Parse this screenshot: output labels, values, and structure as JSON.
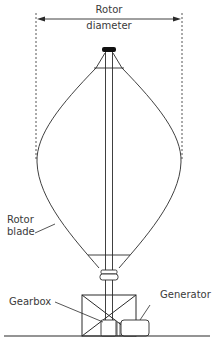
{
  "labels": {
    "rotor_diameter_line1": "Rotor",
    "rotor_diameter_line2": "diameter",
    "rotor_blade_line1": "Rotor",
    "rotor_blade_line2": "blade",
    "gearbox": "Gearbox",
    "generator": "Generator"
  },
  "colors": {
    "line": "#2a2a2a",
    "text": "#3a3a3a",
    "background": "#ffffff"
  }
}
